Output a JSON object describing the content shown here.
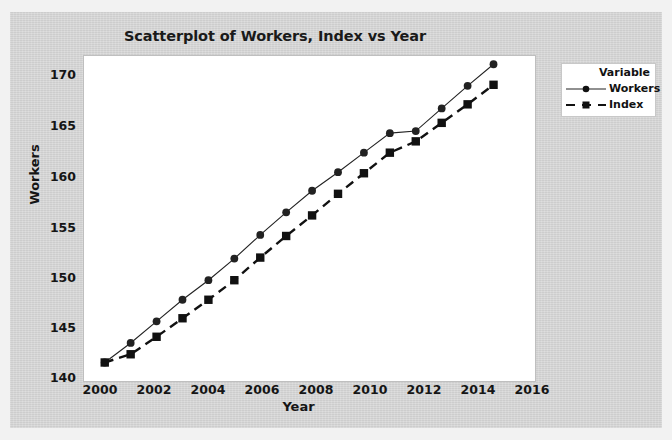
{
  "chart_data": {
    "type": "line",
    "title": "Scatterplot of Workers, Index vs Year",
    "xlabel": "Year",
    "ylabel": "Workers",
    "x": [
      2000,
      2001,
      2002,
      2003,
      2004,
      2005,
      2006,
      2007,
      2008,
      2009,
      2010,
      2011,
      2012,
      2013,
      2014,
      2015
    ],
    "series": [
      {
        "name": "Workers",
        "marker": "circle",
        "linestyle": "solid",
        "color": "#222222",
        "values": [
          141.0,
          142.9,
          145.0,
          147.1,
          149.0,
          151.1,
          153.4,
          155.6,
          157.7,
          159.5,
          161.4,
          163.3,
          163.5,
          165.7,
          167.9,
          170.0
        ]
      },
      {
        "name": "Index",
        "marker": "square",
        "linestyle": "dashed",
        "color": "#111111",
        "values": [
          141.0,
          141.8,
          143.5,
          145.3,
          147.1,
          149.0,
          151.2,
          153.3,
          155.3,
          157.4,
          159.4,
          161.4,
          162.5,
          164.3,
          166.1,
          168.0
        ]
      }
    ],
    "xlim": [
      1999.2,
      2016.6
    ],
    "ylim": [
      139.2,
      170.8
    ],
    "xticks": [
      2000,
      2002,
      2004,
      2006,
      2008,
      2010,
      2012,
      2014,
      2016
    ],
    "yticks": [
      140,
      145,
      150,
      155,
      160,
      165,
      170
    ],
    "grid": false,
    "legend_position": "right"
  },
  "legend": {
    "title": "Variable",
    "entries": [
      {
        "label": "Workers"
      },
      {
        "label": "Index"
      }
    ]
  },
  "colors": {
    "panel_background": "#d4d4d4",
    "plot_background": "#ffffff",
    "workers_series": "#222222",
    "index_series": "#111111"
  }
}
